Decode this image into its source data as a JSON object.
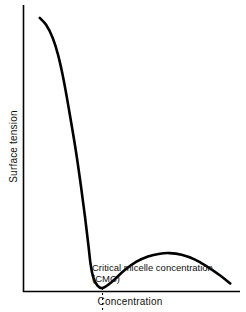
{
  "chart_data": {
    "type": "line",
    "title": "",
    "subtitle": "",
    "xlabel": "Concentration",
    "ylabel": "Surface tension",
    "grid": false,
    "legend": null,
    "axes": {
      "x_ticks": [],
      "y_ticks": [],
      "x_range_qualitative": [
        "low concentration",
        "high concentration"
      ],
      "y_range_qualitative": [
        "low surface tension",
        "high surface tension"
      ],
      "axis_color": "#000000",
      "axis_style": "L-shaped spine, no ticks, no numeric scale"
    },
    "series": [
      {
        "name": "Surface tension vs concentration",
        "color": "#000000",
        "line_width_px": 2.6,
        "description": "Surface tension falls steeply with increasing surfactant concentration, reaches a minimum at the critical micelle concentration, rises to a shallow local maximum, then declines again.",
        "points": [
          {
            "x": 0.075,
            "y": 0.955
          },
          {
            "x": 0.105,
            "y": 0.93
          },
          {
            "x": 0.135,
            "y": 0.885
          },
          {
            "x": 0.16,
            "y": 0.825
          },
          {
            "x": 0.185,
            "y": 0.74
          },
          {
            "x": 0.21,
            "y": 0.635
          },
          {
            "x": 0.24,
            "y": 0.5
          },
          {
            "x": 0.265,
            "y": 0.37
          },
          {
            "x": 0.285,
            "y": 0.255
          },
          {
            "x": 0.3,
            "y": 0.16
          },
          {
            "x": 0.31,
            "y": 0.095
          },
          {
            "x": 0.322,
            "y": 0.05
          },
          {
            "x": 0.34,
            "y": 0.022
          },
          {
            "x": 0.365,
            "y": 0.012
          },
          {
            "x": 0.41,
            "y": 0.035
          },
          {
            "x": 0.465,
            "y": 0.073
          },
          {
            "x": 0.52,
            "y": 0.103
          },
          {
            "x": 0.575,
            "y": 0.122
          },
          {
            "x": 0.63,
            "y": 0.132
          },
          {
            "x": 0.675,
            "y": 0.134
          },
          {
            "x": 0.73,
            "y": 0.128
          },
          {
            "x": 0.79,
            "y": 0.112
          },
          {
            "x": 0.85,
            "y": 0.086
          },
          {
            "x": 0.91,
            "y": 0.055
          },
          {
            "x": 0.955,
            "y": 0.028
          }
        ]
      }
    ],
    "annotations": [
      {
        "name": "cmc-marker",
        "type": "vertical-dashed-line",
        "x": 0.365,
        "y_from": 0.012,
        "y_to": -0.115,
        "color": "#000000",
        "dash": "2,3",
        "label_line1": "Critical micelle concentration",
        "label_line2": "(CMC)"
      }
    ]
  },
  "labels": {
    "y_axis": "Surface tension",
    "x_axis": "Concentration",
    "cmc_line1": "Critical micelle concentration",
    "cmc_line2": "(CMC)"
  },
  "colors": {
    "background": "#ffffff",
    "curve": "#000000",
    "axis": "#000000",
    "text": "#111111"
  }
}
